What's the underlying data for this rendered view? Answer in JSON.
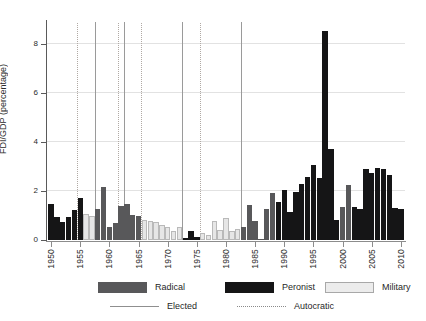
{
  "chart_data": {
    "type": "bar",
    "title": "",
    "xlabel": "",
    "ylabel": "FDI/GDP (percentage)",
    "ylim": [
      0,
      8.9
    ],
    "xlim": [
      1949.3,
      2010.7
    ],
    "yticks": [
      0,
      2,
      4,
      6,
      8
    ],
    "xticks": [
      1950,
      1955,
      1960,
      1965,
      1970,
      1975,
      1980,
      1985,
      1990,
      1995,
      2000,
      2005,
      2010
    ],
    "grid": "horizontal",
    "legend_position": "below-axes",
    "categories": [
      1950,
      1951,
      1952,
      1953,
      1954,
      1955,
      1956,
      1957,
      1958,
      1959,
      1960,
      1961,
      1962,
      1963,
      1964,
      1965,
      1966,
      1967,
      1968,
      1969,
      1970,
      1971,
      1972,
      1973,
      1974,
      1975,
      1976,
      1977,
      1978,
      1979,
      1980,
      1981,
      1982,
      1983,
      1984,
      1985,
      1986,
      1987,
      1988,
      1989,
      1990,
      1991,
      1992,
      1993,
      1994,
      1995,
      1996,
      1997,
      1998,
      1999,
      2000,
      2001,
      2002,
      2003,
      2004,
      2005,
      2006,
      2007,
      2008,
      2009,
      2010
    ],
    "values": [
      1.48,
      0.95,
      0.72,
      0.95,
      1.22,
      1.72,
      1.05,
      0.97,
      1.28,
      2.18,
      0.52,
      0.68,
      1.38,
      1.45,
      1.02,
      0.97,
      0.82,
      0.78,
      0.72,
      0.62,
      0.55,
      0.38,
      0.52,
      0.1,
      0.36,
      0.12,
      0.28,
      0.22,
      0.78,
      0.42,
      0.88,
      0.36,
      0.45,
      0.52,
      1.42,
      0.78,
      0.04,
      1.25,
      1.92,
      1.55,
      2.05,
      1.15,
      1.95,
      2.28,
      2.58,
      3.05,
      2.52,
      8.52,
      3.72,
      0.82,
      1.35,
      2.25,
      1.35,
      1.25,
      2.88,
      2.72,
      2.92,
      2.88,
      2.65,
      1.32,
      1.28
    ],
    "series_groups": [
      {
        "name": "Radical",
        "color": "#58585a"
      },
      {
        "name": "Peronist",
        "color": "#151516"
      },
      {
        "name": "Military",
        "color": "#e6e6e6"
      }
    ],
    "bar_parties": [
      "peronist",
      "peronist",
      "peronist",
      "peronist",
      "peronist",
      "peronist",
      "military",
      "military",
      "radical",
      "radical",
      "radical",
      "radical",
      "radical",
      "radical",
      "radical",
      "radical",
      "military",
      "military",
      "military",
      "military",
      "military",
      "military",
      "military",
      "peronist",
      "peronist",
      "peronist",
      "military",
      "military",
      "military",
      "military",
      "military",
      "military",
      "military",
      "radical",
      "radical",
      "radical",
      "radical",
      "radical",
      "radical",
      "peronist",
      "peronist",
      "peronist",
      "peronist",
      "peronist",
      "peronist",
      "peronist",
      "peronist",
      "peronist",
      "peronist",
      "peronist",
      "radical",
      "radical",
      "peronist",
      "peronist",
      "peronist",
      "peronist",
      "peronist",
      "peronist",
      "peronist",
      "peronist",
      "peronist"
    ],
    "regime_lines": [
      {
        "year": 1955,
        "type": "autocratic"
      },
      {
        "year": 1958,
        "type": "elected"
      },
      {
        "year": 1962,
        "type": "autocratic"
      },
      {
        "year": 1963,
        "type": "elected"
      },
      {
        "year": 1966,
        "type": "autocratic"
      },
      {
        "year": 1973,
        "type": "elected"
      },
      {
        "year": 1976,
        "type": "autocratic"
      },
      {
        "year": 1983,
        "type": "elected"
      }
    ]
  },
  "legend": {
    "parties": [
      {
        "label": "Radical",
        "key": "radical"
      },
      {
        "label": "Peronist",
        "key": "peronist"
      },
      {
        "label": "Military",
        "key": "military"
      }
    ],
    "regimes": [
      {
        "label": "Elected",
        "key": "elected"
      },
      {
        "label": "Autocratic",
        "key": "autocratic"
      }
    ]
  },
  "colors": {
    "radical": "#58585a",
    "peronist": "#151516",
    "military": "#e6e6e6",
    "military_border": "#b9b9b9",
    "gridline": "#e2e2e2",
    "axis": "#5a5a5a",
    "elected_line": "#9a9a9a",
    "autocratic_line": "#b0a9a4",
    "text": "#1f1f1f",
    "background": "#ffffff"
  }
}
